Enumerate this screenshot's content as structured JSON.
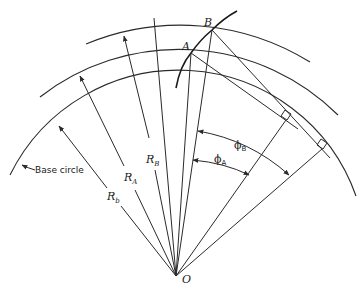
{
  "diagram": {
    "points": {
      "A": {
        "label": "A"
      },
      "B": {
        "label": "B"
      },
      "O": {
        "label": "O"
      }
    },
    "radii": {
      "R_B": {
        "label": "R",
        "sub": "B"
      },
      "R_A": {
        "label": "R",
        "sub": "A"
      },
      "R_b": {
        "label": "R",
        "sub": "b"
      }
    },
    "angles": {
      "phi_A": {
        "label": "ϕ",
        "sub": "A"
      },
      "phi_B": {
        "label": "ϕ",
        "sub": "B"
      }
    },
    "annotations": {
      "base_circle": "Base circle"
    },
    "colors": {
      "line": "#2a2a2a",
      "background": "#ffffff"
    }
  }
}
